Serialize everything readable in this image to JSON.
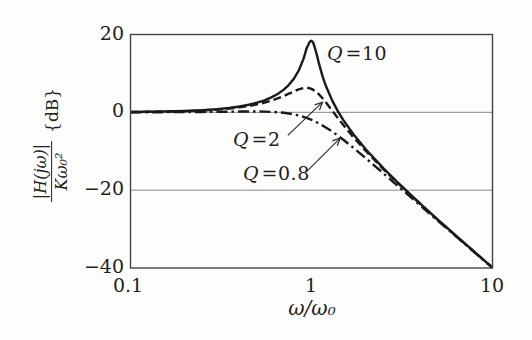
{
  "figure": {
    "background": "#fdfdfc"
  },
  "chart_data": {
    "type": "line",
    "title": "",
    "xlabel": "ω/ω₀",
    "ylabel_numerator": "|H(jω)|",
    "ylabel_denominator": "Kω₀²",
    "ylabel_unit": "{dB}",
    "x_scale": "log",
    "xlim": [
      0.1,
      10
    ],
    "ylim": [
      -40,
      20
    ],
    "xtick_labels": [
      "0.1",
      "1",
      "10"
    ],
    "xtick_values": [
      0.1,
      1,
      10
    ],
    "ytick_labels": [
      "20",
      "0",
      "−20",
      "−40"
    ],
    "ytick_values": [
      20,
      0,
      -20,
      -40
    ],
    "gridlines_db": [
      0,
      -20
    ],
    "grid": "horizontal-only",
    "legend": "inline-annotations",
    "x": [
      0.1,
      0.15,
      0.2,
      0.25,
      0.3,
      0.35,
      0.4,
      0.45,
      0.5,
      0.55,
      0.6,
      0.65,
      0.7,
      0.75,
      0.8,
      0.85,
      0.9,
      0.92,
      0.94,
      0.96,
      0.98,
      1.0,
      1.02,
      1.04,
      1.06,
      1.08,
      1.1,
      1.15,
      1.2,
      1.3,
      1.4,
      1.5,
      1.7,
      2.0,
      2.5,
      3.0,
      4.0,
      5.0,
      7.0,
      10.0
    ],
    "series": [
      {
        "name": "Q=10",
        "q": 10,
        "style": "solid",
        "values": [
          0.09,
          0.2,
          0.35,
          0.56,
          0.81,
          1.13,
          1.5,
          1.95,
          2.48,
          3.1,
          3.84,
          4.71,
          5.77,
          7.06,
          8.66,
          10.75,
          13.55,
          14.94,
          16.5,
          17.3,
          18.2,
          18.4,
          18.0,
          16.8,
          15.5,
          14.05,
          12.5,
          9.31,
          6.82,
          3.07,
          0.26,
          -2.0,
          -5.56,
          -9.56,
          -14.41,
          -18.07,
          -23.53,
          -27.61,
          -33.63,
          -39.91
        ]
      },
      {
        "name": "Q=2",
        "q": 2,
        "style": "dashed",
        "values": [
          0.08,
          0.17,
          0.31,
          0.48,
          0.7,
          0.97,
          1.27,
          1.63,
          2.04,
          2.5,
          3.01,
          3.57,
          4.17,
          4.79,
          5.38,
          5.89,
          6.22,
          6.29,
          6.3,
          6.26,
          6.17,
          6.02,
          5.82,
          5.57,
          5.29,
          4.96,
          4.6,
          3.62,
          2.57,
          0.46,
          -1.5,
          -3.27,
          -6.33,
          -10.0,
          -14.64,
          -18.21,
          -23.6,
          -27.65,
          -33.65,
          -39.92
        ]
      },
      {
        "name": "Q=0.8",
        "q": 0.8,
        "style": "dashdot",
        "values": [
          0.02,
          0.04,
          0.07,
          0.1,
          0.14,
          0.17,
          0.2,
          0.21,
          0.21,
          0.18,
          0.12,
          0.03,
          -0.11,
          -0.3,
          -0.53,
          -0.81,
          -1.14,
          -1.29,
          -1.44,
          -1.6,
          -1.77,
          -1.94,
          -2.11,
          -2.3,
          -2.48,
          -2.67,
          -2.87,
          -3.37,
          -3.88,
          -4.94,
          -6.0,
          -7.06,
          -9.08,
          -11.83,
          -15.72,
          -18.92,
          -23.98,
          -27.89,
          -33.77,
          -39.98
        ]
      }
    ],
    "annotations": [
      {
        "sym": "Q",
        "val": "=10",
        "series": "Q=10",
        "arrow": null
      },
      {
        "sym": "Q",
        "val": "=2",
        "series": "Q=2",
        "arrow": {
          "from": [
            0.74,
            -5.9
          ],
          "to": [
            1.15,
            2.6
          ]
        }
      },
      {
        "sym": "Q",
        "val": "=0.8",
        "series": "Q=0.8",
        "arrow": {
          "from": [
            0.93,
            -15.4
          ],
          "to": [
            1.44,
            -6.6
          ]
        }
      }
    ],
    "colors": {
      "curve": "#1a1a1a",
      "grid": "#8a8a8a",
      "frame": "#444444",
      "arrow": "#2a2a2a",
      "text": "#1f1f1f"
    }
  }
}
